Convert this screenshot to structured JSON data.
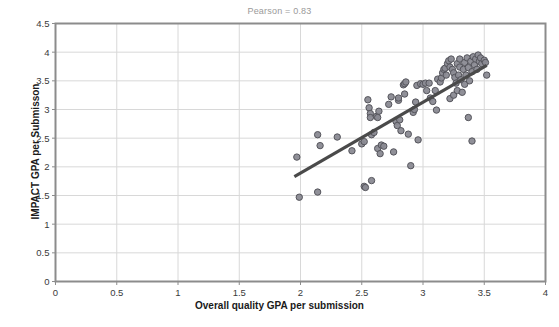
{
  "chart_data": {
    "type": "scatter",
    "title": "Pearson = 0.83",
    "xlabel": "Overall quality GPA per submission",
    "ylabel": "IMPACT GPA per Submisson",
    "xlim": [
      0,
      4
    ],
    "ylim": [
      0,
      4.5
    ],
    "xticks": [
      "0",
      "0.5",
      "1",
      "1.5",
      "2",
      "2.5",
      "3",
      "3.5",
      "4"
    ],
    "yticks": [
      "0",
      "0.5",
      "1",
      "1.5",
      "2",
      "2.5",
      "3",
      "3.5",
      "4",
      "4.5"
    ],
    "xtick_values": [
      0,
      0.5,
      1,
      1.5,
      2,
      2.5,
      3,
      3.5,
      4
    ],
    "ytick_values": [
      0,
      0.5,
      1,
      1.5,
      2,
      2.5,
      3,
      3.5,
      4,
      4.5
    ],
    "grid": true,
    "legend": "none",
    "marker_fill": "#8a8a92",
    "marker_stroke": "#55555c",
    "marker_radius": 3.2,
    "trendline": {
      "color": "#4a4a4a",
      "width": 3.2,
      "x0": 1.95,
      "y0": 1.83,
      "x1": 3.52,
      "y1": 3.77
    },
    "grid_color": "#d8d8d8",
    "frame_color": "#8c8c8c",
    "series": [
      {
        "name": "submissions",
        "points": [
          [
            1.97,
            2.17
          ],
          [
            1.99,
            1.47
          ],
          [
            2.14,
            2.56
          ],
          [
            2.14,
            1.56
          ],
          [
            2.16,
            2.37
          ],
          [
            2.3,
            2.52
          ],
          [
            2.42,
            2.28
          ],
          [
            2.5,
            2.4
          ],
          [
            2.52,
            2.44
          ],
          [
            2.52,
            1.66
          ],
          [
            2.53,
            1.64
          ],
          [
            2.55,
            3.17
          ],
          [
            2.56,
            3.03
          ],
          [
            2.57,
            2.93
          ],
          [
            2.57,
            2.86
          ],
          [
            2.58,
            2.56
          ],
          [
            2.58,
            1.76
          ],
          [
            2.6,
            2.6
          ],
          [
            2.62,
            2.88
          ],
          [
            2.63,
            2.86
          ],
          [
            2.63,
            2.32
          ],
          [
            2.64,
            2.97
          ],
          [
            2.65,
            2.23
          ],
          [
            2.66,
            2.38
          ],
          [
            2.68,
            2.36
          ],
          [
            2.72,
            3.09
          ],
          [
            2.74,
            3.22
          ],
          [
            2.76,
            2.26
          ],
          [
            2.78,
            2.79
          ],
          [
            2.79,
            2.72
          ],
          [
            2.8,
            3.16
          ],
          [
            2.8,
            3.2
          ],
          [
            2.81,
            2.82
          ],
          [
            2.82,
            2.63
          ],
          [
            2.84,
            3.43
          ],
          [
            2.85,
            3.45
          ],
          [
            2.85,
            3.27
          ],
          [
            2.86,
            3.48
          ],
          [
            2.88,
            2.57
          ],
          [
            2.9,
            2.02
          ],
          [
            2.92,
            2.95
          ],
          [
            2.93,
            3.0
          ],
          [
            2.94,
            3.13
          ],
          [
            2.95,
            3.42
          ],
          [
            2.96,
            2.47
          ],
          [
            2.98,
            3.45
          ],
          [
            3.0,
            3.44
          ],
          [
            3.02,
            3.46
          ],
          [
            3.03,
            3.33
          ],
          [
            3.05,
            3.46
          ],
          [
            3.06,
            3.2
          ],
          [
            3.08,
            3.14
          ],
          [
            3.1,
            3.33
          ],
          [
            3.11,
            2.99
          ],
          [
            3.12,
            3.53
          ],
          [
            3.14,
            3.48
          ],
          [
            3.15,
            3.55
          ],
          [
            3.16,
            3.64
          ],
          [
            3.17,
            3.7
          ],
          [
            3.18,
            3.72
          ],
          [
            3.19,
            3.6
          ],
          [
            3.2,
            3.8
          ],
          [
            3.21,
            3.85
          ],
          [
            3.22,
            3.74
          ],
          [
            3.22,
            3.19
          ],
          [
            3.23,
            3.88
          ],
          [
            3.24,
            3.7
          ],
          [
            3.25,
            3.64
          ],
          [
            3.25,
            3.25
          ],
          [
            3.26,
            3.56
          ],
          [
            3.27,
            3.46
          ],
          [
            3.28,
            3.8
          ],
          [
            3.28,
            3.33
          ],
          [
            3.29,
            3.6
          ],
          [
            3.3,
            3.88
          ],
          [
            3.3,
            3.74
          ],
          [
            3.31,
            3.52
          ],
          [
            3.32,
            3.3
          ],
          [
            3.33,
            3.7
          ],
          [
            3.34,
            3.82
          ],
          [
            3.34,
            3.44
          ],
          [
            3.35,
            3.6
          ],
          [
            3.36,
            3.9
          ],
          [
            3.37,
            3.73
          ],
          [
            3.37,
            2.86
          ],
          [
            3.38,
            3.5
          ],
          [
            3.39,
            3.84
          ],
          [
            3.4,
            3.66
          ],
          [
            3.4,
            2.45
          ],
          [
            3.41,
            3.92
          ],
          [
            3.42,
            3.78
          ],
          [
            3.43,
            3.88
          ],
          [
            3.44,
            3.7
          ],
          [
            3.45,
            3.95
          ],
          [
            3.46,
            3.84
          ],
          [
            3.47,
            3.9
          ],
          [
            3.48,
            3.8
          ],
          [
            3.5,
            3.86
          ],
          [
            3.51,
            3.82
          ],
          [
            3.52,
            3.6
          ]
        ]
      }
    ]
  }
}
